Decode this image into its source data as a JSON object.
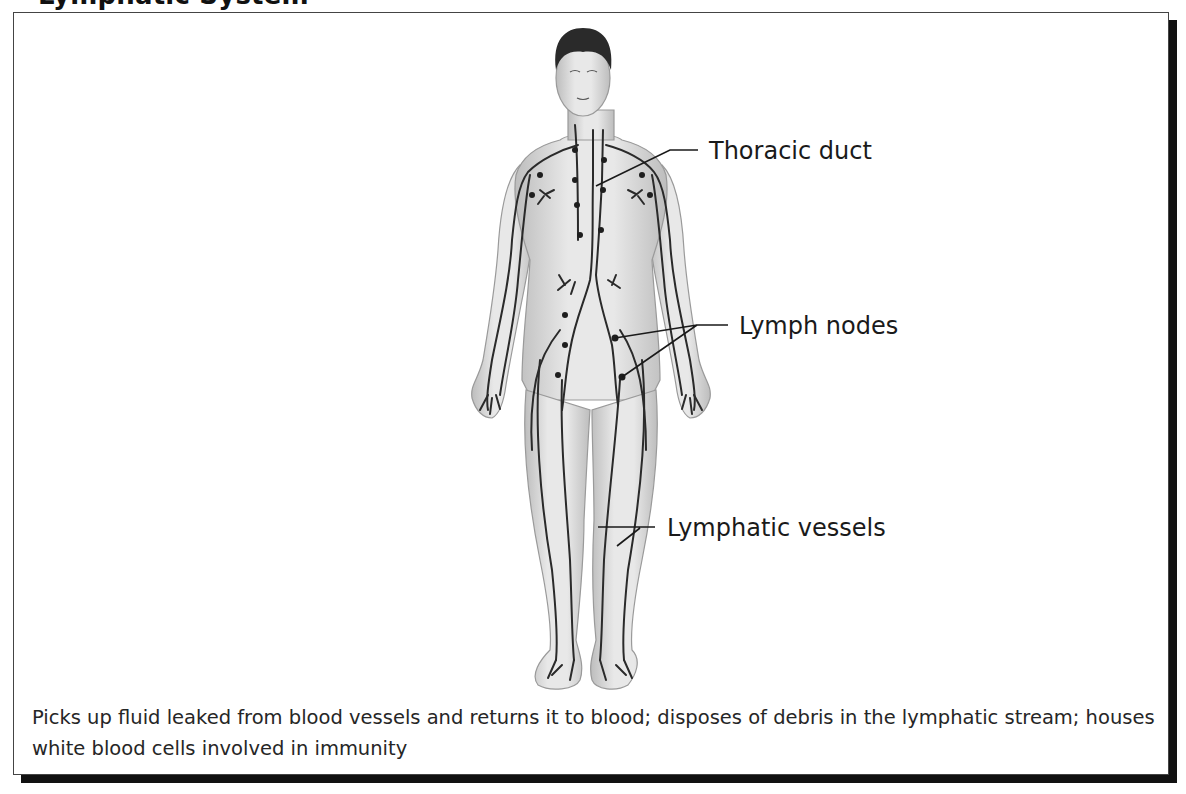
{
  "title": "Lymphatic System",
  "figure": {
    "labels": [
      {
        "id": "thoracic-duct",
        "text": "Thoracic duct"
      },
      {
        "id": "lymph-nodes",
        "text": "Lymph nodes"
      },
      {
        "id": "lymphatic-vessels",
        "text": "Lymphatic vessels"
      }
    ]
  },
  "caption": "Picks up fluid leaked from blood vessels and returns it to blood; disposes of debris in the lymphatic stream; houses white blood cells involved in immunity",
  "colors": {
    "border": "#444444",
    "shadow": "#111111",
    "skin": "#d9d9d9",
    "vessel": "#2a2a2a"
  }
}
